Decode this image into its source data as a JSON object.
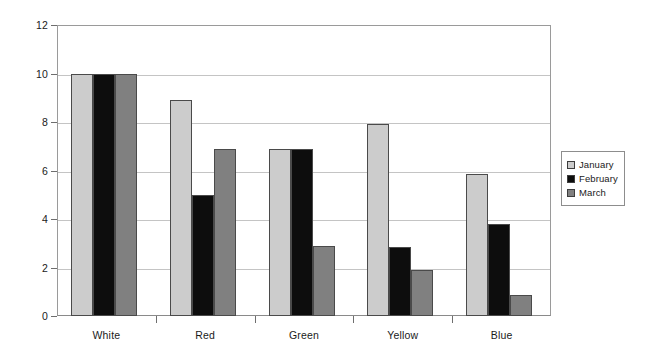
{
  "chart_data": {
    "type": "bar",
    "title": "",
    "subtitle": "",
    "xlabel": "",
    "ylabel": "",
    "categories": [
      "White",
      "Red",
      "Green",
      "Yellow",
      "Blue"
    ],
    "series": [
      {
        "name": "January",
        "color": "#cccccc",
        "values": [
          10,
          8.9,
          6.9,
          7.9,
          5.85
        ]
      },
      {
        "name": "February",
        "color": "#0d0d0d",
        "values": [
          10,
          5.0,
          6.9,
          2.85,
          3.8
        ]
      },
      {
        "name": "March",
        "color": "#808080",
        "values": [
          10,
          6.9,
          2.9,
          1.9,
          0.85
        ]
      }
    ],
    "ylim": [
      0,
      12
    ],
    "y_ticks": [
      0,
      2,
      4,
      6,
      8,
      10,
      12
    ],
    "y_tick_labels": [
      "0",
      "2",
      "4",
      "6",
      "8",
      "10",
      "12"
    ],
    "grid": true,
    "grid_axis": "y",
    "legend_position": "right",
    "annotations": []
  },
  "axis": {
    "y_tick_labels": [
      "12",
      "10",
      "8",
      "6",
      "4",
      "2",
      "0"
    ],
    "x_tick_labels": [
      "White",
      "Red",
      "Green",
      "Yellow",
      "Blue"
    ]
  },
  "legend": {
    "entries": [
      {
        "label": "January",
        "color": "#cccccc"
      },
      {
        "label": "February",
        "color": "#0d0d0d"
      },
      {
        "label": "March",
        "color": "#808080"
      }
    ]
  },
  "colors": {
    "background": "#ffffff",
    "gridline": "#c4c4c4",
    "axis_line": "#9a9a9a",
    "bar_border": "#4a4a4a",
    "text": "#1a1a1a"
  }
}
